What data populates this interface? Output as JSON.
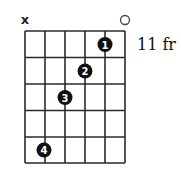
{
  "chord_diagram": {
    "fret_position_label": "11 fr",
    "strings": 6,
    "frets": 5,
    "string_markers": [
      {
        "string": 1,
        "type": "muted",
        "symbol": "x"
      },
      {
        "string": 6,
        "type": "open",
        "symbol": "o"
      }
    ],
    "fingers": [
      {
        "finger": "1",
        "string": 5,
        "fret": 1
      },
      {
        "finger": "2",
        "string": 4,
        "fret": 2
      },
      {
        "finger": "3",
        "string": 3,
        "fret": 3
      },
      {
        "finger": "4",
        "string": 2,
        "fret": 5
      }
    ],
    "colors": {
      "grid": "#2a2a2a",
      "dot": "#111111",
      "dot_text": "#ffffff",
      "background": "#ffffff"
    }
  }
}
